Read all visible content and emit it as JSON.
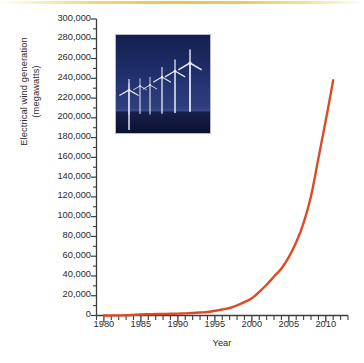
{
  "figure": {
    "accent_rule_color": "#e8c646",
    "background_color": "#ffffff"
  },
  "photo": {
    "name": "wind-turbine-farm-photo",
    "alt": "Row of white wind turbines at dusk against deep blue sky",
    "sky_color": "#1b2a63",
    "ground_color": "#0d1533",
    "turbine_color": "#e8eaf2"
  },
  "chart_data": {
    "type": "line",
    "title": "",
    "xlabel": "Year",
    "ylabel": "Electrical wind generation (megawatts)",
    "ylabel_line1": "Electrical wind generation",
    "ylabel_line2": "(megawatts)",
    "xlim": [
      1979,
      2013
    ],
    "ylim": [
      0,
      300000
    ],
    "grid": false,
    "legend": "none",
    "line_color": "#dd4b26",
    "line_width": 2.4,
    "ytick_step": 20000,
    "xtick_step": 1,
    "xtick_label_step": 5,
    "ytick_labels": [
      "300,000",
      "280,000",
      "260,000",
      "240,000",
      "220,000",
      "200,000",
      "180,000",
      "160,000",
      "140,000",
      "120,000",
      "100,000",
      "80,000",
      "60,000",
      "40,000",
      "20,000",
      "0"
    ],
    "ytick_values": [
      300000,
      280000,
      260000,
      240000,
      220000,
      200000,
      180000,
      160000,
      140000,
      120000,
      100000,
      80000,
      60000,
      40000,
      20000,
      0
    ],
    "xtick_values": [
      1979,
      1980,
      1981,
      1982,
      1983,
      1984,
      1985,
      1986,
      1987,
      1988,
      1989,
      1990,
      1991,
      1992,
      1993,
      1994,
      1995,
      1996,
      1997,
      1998,
      1999,
      2000,
      2001,
      2002,
      2003,
      2004,
      2005,
      2006,
      2007,
      2008,
      2009,
      2010,
      2011,
      2012,
      2013
    ],
    "xtick_labels": [
      "1980",
      "1985",
      "1990",
      "1995",
      "2000",
      "2005",
      "2010"
    ],
    "xtick_label_values": [
      1980,
      1985,
      1990,
      1995,
      2000,
      2005,
      2010
    ],
    "series": [
      {
        "name": "Global installed wind capacity",
        "x": [
          1980,
          1981,
          1982,
          1983,
          1984,
          1985,
          1986,
          1987,
          1988,
          1989,
          1990,
          1991,
          1992,
          1993,
          1994,
          1995,
          1996,
          1997,
          1998,
          1999,
          2000,
          2001,
          2002,
          2003,
          2004,
          2005,
          2006,
          2007,
          2008,
          2009,
          2010,
          2011
        ],
        "values": [
          10,
          25,
          90,
          210,
          600,
          1020,
          1270,
          1450,
          1580,
          1730,
          1930,
          2170,
          2510,
          2990,
          3490,
          4780,
          6100,
          7600,
          10200,
          13600,
          17400,
          23900,
          31100,
          39431,
          47620,
          59091,
          74052,
          93820,
          120690,
          158975,
          197637,
          238000
        ]
      }
    ],
    "endpoint": {
      "x": 2011,
      "y": 238000
    }
  }
}
